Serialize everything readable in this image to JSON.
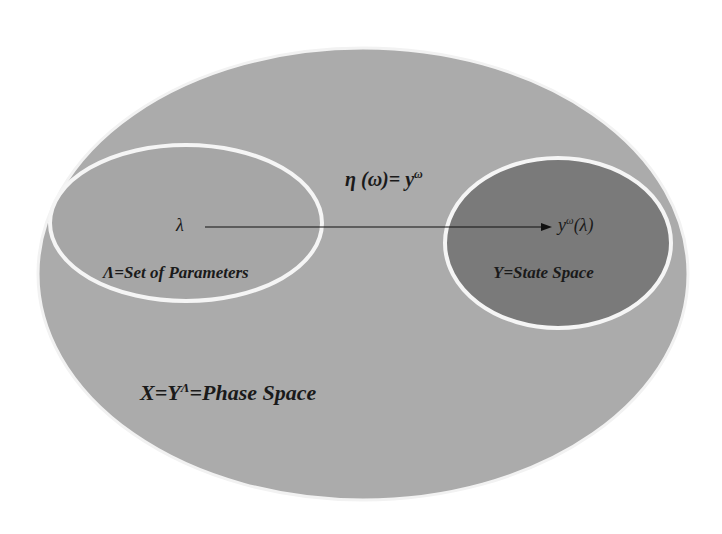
{
  "diagram": {
    "outer": {
      "label_main": "X=Y",
      "label_sup": "Λ",
      "label_rest": "=Phase Space",
      "fill": "#ababab",
      "stroke": "#f2f2f2"
    },
    "parameters_set": {
      "symbol": "λ",
      "label": "Λ=Set of Parameters",
      "fill": "#a6a6a6",
      "stroke": "#f5f5f5"
    },
    "state_space": {
      "symbol_base": "y",
      "symbol_sup": "ω",
      "symbol_tail": "(λ)",
      "label": "Y=State Space",
      "fill": "#7a7a7a",
      "stroke": "#f5f5f5"
    },
    "mapping": {
      "label_main": "η (ω)= y",
      "label_sup": "ω",
      "arrow_color": "#111111"
    }
  }
}
